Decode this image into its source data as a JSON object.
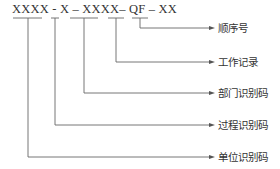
{
  "code": {
    "text": "XXXX - X – XXXX– QF – XX",
    "segments": [
      "XXXX",
      "X",
      "XXXX",
      "QF",
      "XX"
    ]
  },
  "labels": [
    {
      "text": "顺序号",
      "segment": "XX"
    },
    {
      "text": "工作记录",
      "segment": "QF"
    },
    {
      "text": "部门识别码",
      "segment": "XXXX"
    },
    {
      "text": "过程识别码",
      "segment": "X"
    },
    {
      "text": "单位识别码",
      "segment": "XXXX"
    }
  ],
  "colors": {
    "line": "#555555",
    "text": "#333333"
  }
}
